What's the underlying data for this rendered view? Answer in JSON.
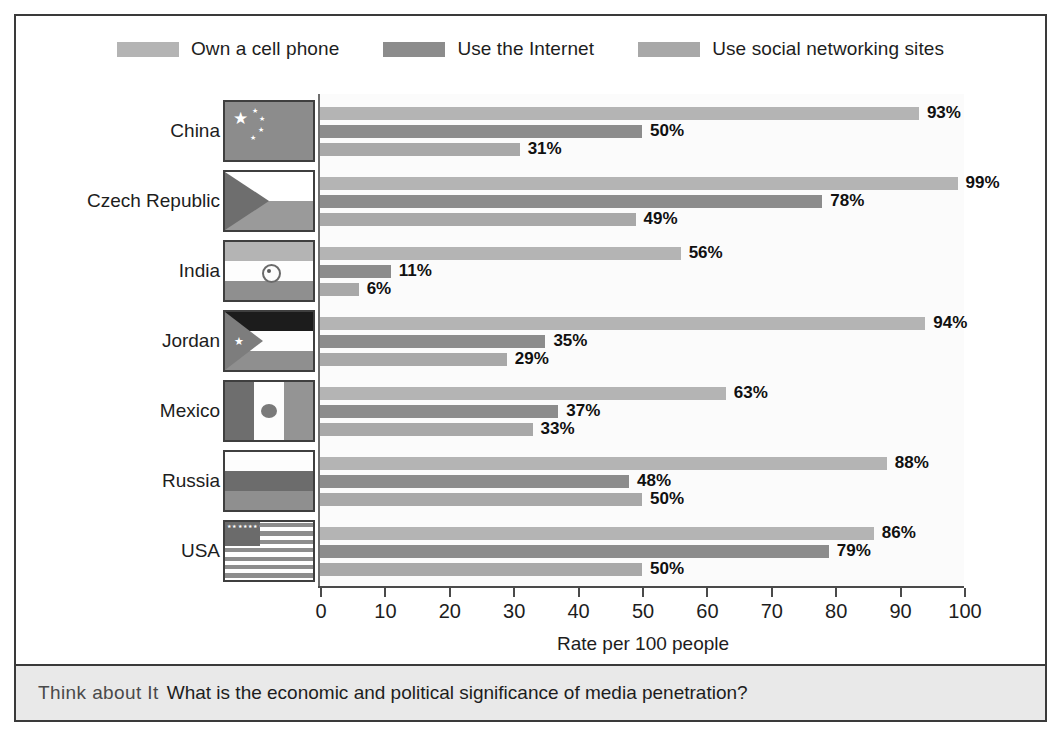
{
  "legend": {
    "items": [
      {
        "label": "Own a cell phone",
        "color": "#b4b4b4",
        "key": "cell"
      },
      {
        "label": "Use the Internet",
        "color": "#8c8c8c",
        "key": "internet"
      },
      {
        "label": "Use social networking sites",
        "color": "#a8a8a8",
        "key": "social"
      }
    ]
  },
  "axis": {
    "xlabel": "Rate per 100 people",
    "ticks": [
      0,
      10,
      20,
      30,
      40,
      50,
      60,
      70,
      80,
      90,
      100
    ],
    "tick_labels": [
      "0",
      "10",
      "20",
      "30",
      "40",
      "50",
      "60",
      "70",
      "80",
      "90",
      "100"
    ],
    "min": 0,
    "max": 100
  },
  "footer": {
    "lead": "Think about It",
    "question": "What is the economic and political significance of media penetration?"
  },
  "chart_data": {
    "type": "bar",
    "orientation": "horizontal",
    "title": "",
    "xlabel": "Rate per 100 people",
    "ylabel": "",
    "xlim": [
      0,
      100
    ],
    "grid": false,
    "legend_position": "top",
    "categories": [
      "China",
      "Czech Republic",
      "India",
      "Jordan",
      "Mexico",
      "Russia",
      "USA"
    ],
    "series": [
      {
        "name": "Own a cell phone",
        "color": "#b4b4b4",
        "values": [
          93,
          99,
          56,
          94,
          63,
          88,
          86
        ]
      },
      {
        "name": "Use the Internet",
        "color": "#8c8c8c",
        "values": [
          50,
          78,
          11,
          35,
          37,
          48,
          79
        ]
      },
      {
        "name": "Use social networking sites",
        "color": "#a8a8a8",
        "values": [
          31,
          49,
          6,
          29,
          33,
          50,
          50
        ]
      }
    ],
    "data_labels": [
      [
        "93%",
        "50%",
        "31%"
      ],
      [
        "99%",
        "78%",
        "49%"
      ],
      [
        "56%",
        "11%",
        "6%"
      ],
      [
        "94%",
        "35%",
        "29%"
      ],
      [
        "63%",
        "37%",
        "33%"
      ],
      [
        "88%",
        "48%",
        "50%"
      ],
      [
        "86%",
        "79%",
        "50%"
      ]
    ]
  },
  "countries": [
    {
      "name": "China",
      "flag": "flag-china",
      "values": [
        93,
        50,
        31
      ],
      "labels": [
        "93%",
        "50%",
        "31%"
      ]
    },
    {
      "name": "Czech Republic",
      "flag": "flag-czech",
      "values": [
        99,
        78,
        49
      ],
      "labels": [
        "99%",
        "78%",
        "49%"
      ]
    },
    {
      "name": "India",
      "flag": "flag-india",
      "values": [
        56,
        11,
        6
      ],
      "labels": [
        "56%",
        "11%",
        "6%"
      ]
    },
    {
      "name": "Jordan",
      "flag": "flag-jordan",
      "values": [
        94,
        35,
        29
      ],
      "labels": [
        "94%",
        "35%",
        "29%"
      ]
    },
    {
      "name": "Mexico",
      "flag": "flag-mexico",
      "values": [
        63,
        37,
        33
      ],
      "labels": [
        "63%",
        "37%",
        "33%"
      ]
    },
    {
      "name": "Russia",
      "flag": "flag-russia",
      "values": [
        88,
        48,
        50
      ],
      "labels": [
        "88%",
        "48%",
        "50%"
      ]
    },
    {
      "name": "USA",
      "flag": "flag-usa",
      "values": [
        86,
        79,
        50
      ],
      "labels": [
        "86%",
        "79%",
        "50%"
      ]
    }
  ]
}
